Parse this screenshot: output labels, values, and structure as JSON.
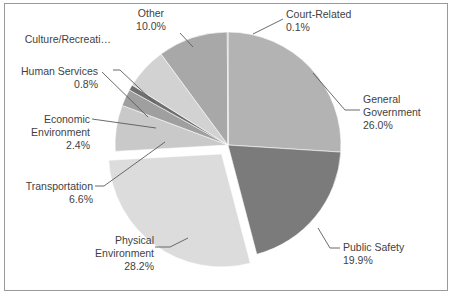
{
  "chart_data": {
    "type": "pie",
    "title": "",
    "subtitle": "",
    "xlabel": "",
    "ylabel": "",
    "grid": false,
    "legend_position": "none",
    "label_format": "name + percent",
    "start_angle_deg": 0,
    "direction": "clockwise",
    "exploded_slices": [
      "Physical Environment"
    ],
    "categories": [
      "General Government",
      "Public Safety",
      "Physical Environment",
      "Transportation",
      "Economic Environment",
      "Human Services",
      "Culture/Recreation",
      "Other",
      "Court-Related"
    ],
    "values": [
      26.0,
      19.9,
      28.2,
      6.6,
      2.4,
      0.8,
      6.0,
      10.0,
      0.1
    ],
    "colors": [
      "#b3b3b3",
      "#7b7b7b",
      "#dcdcdc",
      "#c9c9c9",
      "#9f9f9f",
      "#6f6f6f",
      "#d2d2d2",
      "#a8a8a8",
      "#8d8d8d"
    ],
    "units": "percent"
  },
  "frame": {
    "border_color": "#9a9a9a",
    "background": "#ffffff"
  },
  "labels": {
    "general_government": {
      "name_line1": "General",
      "name_line2": "Government",
      "percent": "26.0%"
    },
    "public_safety": {
      "name_line1": "Public Safety",
      "percent": "19.9%"
    },
    "physical_environment": {
      "name_line1": "Physical",
      "name_line2": "Environment",
      "percent": "28.2%"
    },
    "transportation": {
      "name_line1": "Transportation",
      "percent": "6.6%"
    },
    "economic_environment": {
      "name_line1": "Economic",
      "name_line2": "Environment",
      "percent": "2.4%"
    },
    "human_services": {
      "name_line1": "Human Services",
      "percent": "0.8%"
    },
    "culture_recreation": {
      "name_line1": "Culture/Recreati…",
      "percent": ""
    },
    "other": {
      "name_line1": "Other",
      "percent": "10.0%"
    },
    "court_related": {
      "name_line1": "Court-Related",
      "percent": "0.1%"
    }
  }
}
